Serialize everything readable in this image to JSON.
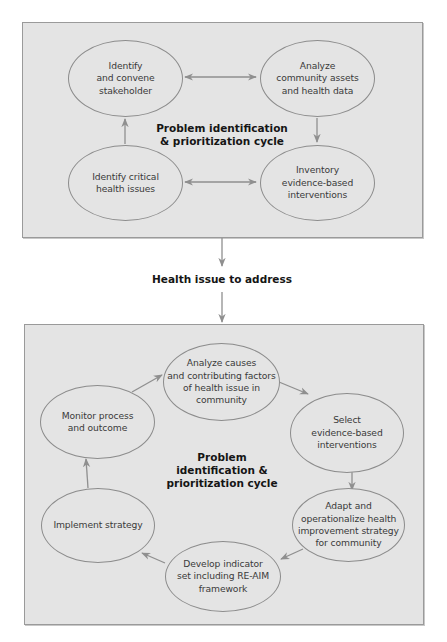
{
  "colors": {
    "panel_fill": "#e4e4e4",
    "panel_border": "#9a9a9a",
    "node_border": "#8c8c8c",
    "arrow": "#8f8f8f",
    "text": "#3a3a3a",
    "bold_text": "#151515"
  },
  "top_panel": {
    "center_label": "Problem identification\n& prioritization cycle",
    "nodes": [
      {
        "id": "identify-convene",
        "label": "Identify\nand convene\nstakeholder"
      },
      {
        "id": "analyze-community",
        "label": "Analyze\ncommunity assets\nand health data"
      },
      {
        "id": "identify-critical",
        "label": "Identify critical\nhealth issues"
      },
      {
        "id": "inventory",
        "label": "Inventory\nevidence-based\ninterventions"
      }
    ],
    "edges": [
      {
        "from": "identify-convene",
        "to": "analyze-community",
        "type": "bidirectional"
      },
      {
        "from": "analyze-community",
        "to": "inventory",
        "type": "directed"
      },
      {
        "from": "identify-critical",
        "to": "inventory",
        "type": "bidirectional"
      },
      {
        "from": "identify-critical",
        "to": "identify-convene",
        "type": "directed"
      }
    ]
  },
  "connector": {
    "label": "Health issue to address"
  },
  "bottom_panel": {
    "center_label": "Problem\nidentification &\nprioritization cycle",
    "nodes": [
      {
        "id": "analyze-causes",
        "label": "Analyze causes\nand contributing factors\nof health issue in\ncommunity"
      },
      {
        "id": "select",
        "label": "Select\nevidence-based\ninterventions"
      },
      {
        "id": "adapt",
        "label": "Adapt and\noperationalize health\nimprovement strategy\nfor community"
      },
      {
        "id": "develop",
        "label": "Develop indicator\nset including RE-AIM\nframework"
      },
      {
        "id": "implement",
        "label": "Implement strategy"
      },
      {
        "id": "monitor",
        "label": "Monitor process\nand outcome"
      }
    ],
    "edges": [
      {
        "from": "monitor",
        "to": "analyze-causes",
        "type": "directed"
      },
      {
        "from": "analyze-causes",
        "to": "select",
        "type": "directed"
      },
      {
        "from": "select",
        "to": "adapt",
        "type": "directed"
      },
      {
        "from": "adapt",
        "to": "develop",
        "type": "directed"
      },
      {
        "from": "develop",
        "to": "implement",
        "type": "directed"
      },
      {
        "from": "implement",
        "to": "monitor",
        "type": "directed"
      }
    ]
  }
}
